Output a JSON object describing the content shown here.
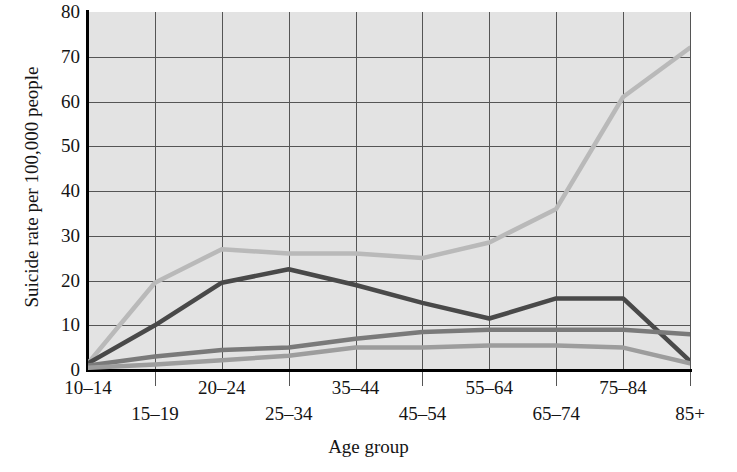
{
  "chart_data": {
    "type": "line",
    "title": "",
    "xlabel": "Age group",
    "ylabel": "Suicide rate per 100,000 people",
    "categories": [
      "10–14",
      "15–19",
      "20–24",
      "25–34",
      "35–44",
      "45–54",
      "55–64",
      "65–74",
      "75–84",
      "85+"
    ],
    "ylim": [
      0,
      80
    ],
    "yticks": [
      0,
      10,
      20,
      30,
      40,
      50,
      60,
      70,
      80
    ],
    "ytick_labels": [
      "0",
      "10",
      "20",
      "30",
      "40",
      "50",
      "60",
      "70",
      "80"
    ],
    "grid": true,
    "legend": "none",
    "series": [
      {
        "name": "series-1-lightest",
        "color": "#b9b9b9",
        "values": [
          1.5,
          19.5,
          27,
          26,
          26,
          25,
          28.5,
          36,
          61,
          72
        ]
      },
      {
        "name": "series-2-darkest",
        "color": "#494949",
        "values": [
          1.5,
          10,
          19.5,
          22.5,
          19,
          15,
          11.5,
          16,
          16,
          2
        ]
      },
      {
        "name": "series-3-medium",
        "color": "#7a7a7a",
        "values": [
          1,
          3,
          4.5,
          5,
          7,
          8.5,
          9,
          9,
          9,
          8
        ]
      },
      {
        "name": "series-4-light",
        "color": "#9d9d9d",
        "values": [
          0.5,
          1.2,
          2.2,
          3.2,
          5,
          5,
          5.5,
          5.5,
          5,
          1.5
        ]
      }
    ]
  },
  "style": {
    "plot_background": "#e3e3e3",
    "grid_color": "#555555",
    "axis_color": "#000000",
    "text_color": "#141414"
  }
}
